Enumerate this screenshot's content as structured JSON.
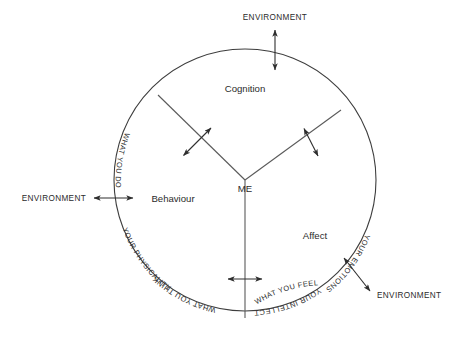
{
  "diagram": {
    "hub": {
      "label": "ME"
    },
    "colors": {
      "outline": "#3d3d3d",
      "spoke": "#5a5a5a",
      "arrow": "#2e2e2e",
      "text": "#2b2b2b",
      "background": "#ffffff"
    },
    "sectors": [
      {
        "name": "cognition",
        "label": "Cognition"
      },
      {
        "name": "affect",
        "label": "Affect"
      },
      {
        "name": "behaviour",
        "label": "Behaviour"
      }
    ],
    "arc_labels": [
      {
        "name": "your-intellect",
        "label": "YOUR INTELLECT"
      },
      {
        "name": "what-you-think",
        "label": "WHAT YOU THINK"
      },
      {
        "name": "your-emotions",
        "label": "YOUR EMOTIONS"
      },
      {
        "name": "what-you-feel",
        "label": "WHAT YOU FEEL"
      },
      {
        "name": "your-physicality",
        "label": "YOUR PHYSICALITY"
      },
      {
        "name": "what-you-do",
        "label": "WHAT YOU DO"
      }
    ],
    "environment_labels": [
      {
        "name": "environment-top",
        "label": "ENVIRONMENT"
      },
      {
        "name": "environment-left",
        "label": "ENVIRONMENT"
      },
      {
        "name": "environment-bottom-right",
        "label": "ENVIRONMENT"
      }
    ]
  }
}
